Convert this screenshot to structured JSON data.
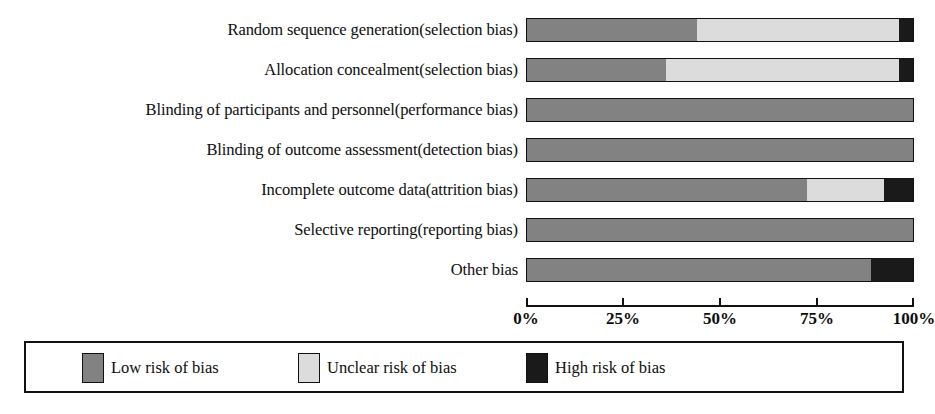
{
  "chart_data": {
    "type": "bar",
    "orientation": "horizontal",
    "stacked": true,
    "stack_mode": "percent",
    "title": "",
    "subtitle": "",
    "xlabel": "",
    "ylabel": "",
    "xlim": [
      0,
      100
    ],
    "grid": false,
    "legend_position": "bottom",
    "axis_ticks": [
      {
        "value": 0,
        "label": "0%"
      },
      {
        "value": 25,
        "label": "25%"
      },
      {
        "value": 50,
        "label": "50%"
      },
      {
        "value": 75,
        "label": "75%"
      },
      {
        "value": 100,
        "label": "100%"
      }
    ],
    "categories": [
      "Random sequence generation(selection bias)",
      "Allocation concealment(selection bias)",
      "Blinding of participants and personnel(performance bias)",
      "Blinding of outcome assessment(detection bias)",
      "Incomplete outcome data(attrition bias)",
      "Selective reporting(reporting bias)",
      "Other bias"
    ],
    "series": [
      {
        "name": "Low risk of bias",
        "color": "#828282",
        "values": [
          44,
          36,
          100,
          100,
          72.5,
          100,
          89
        ]
      },
      {
        "name": "Unclear risk of bias",
        "color": "#dcdcdc",
        "values": [
          52.5,
          60.5,
          0,
          0,
          20,
          0,
          0
        ]
      },
      {
        "name": "High risk of bias",
        "color": "#1a1a1a",
        "values": [
          3.5,
          3.5,
          0,
          0,
          7.5,
          0,
          11
        ]
      }
    ]
  },
  "legend": {
    "items": [
      {
        "label": "Low risk of bias",
        "color": "#828282"
      },
      {
        "label": "Unclear risk of bias",
        "color": "#dcdcdc"
      },
      {
        "label": "High risk of bias",
        "color": "#1a1a1a"
      }
    ]
  }
}
